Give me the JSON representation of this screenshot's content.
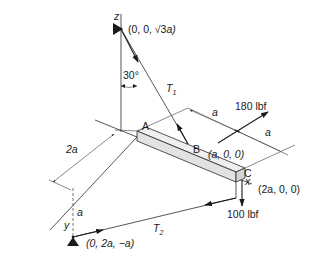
{
  "diagram": {
    "type": "3d-statics-free-body",
    "axes": {
      "z_label": "z",
      "y_label": "y",
      "x_label": "x"
    },
    "points": {
      "A": {
        "label": "A"
      },
      "B": {
        "label": "B",
        "coord": "(a, 0, 0)"
      },
      "C": {
        "label": "C",
        "coord": "(2a, 0, 0)"
      },
      "top_support": {
        "coord_prefix": "(0, 0, ",
        "coord_root": "√3",
        "coord_suffix": "a)"
      },
      "bottom_support": {
        "coord": "(0, 2a, −a)"
      }
    },
    "forces": {
      "T1": {
        "label": "T",
        "sub": "1"
      },
      "T2": {
        "label": "T",
        "sub": "2"
      },
      "F1": {
        "label": "180 lbf"
      },
      "F2": {
        "label": "100 lbf"
      }
    },
    "angle": {
      "label": "30°"
    },
    "dimensions": {
      "dim_2a": "2a",
      "dim_a_vertical": "a",
      "dim_a_top": "a",
      "dim_a_right": "a"
    },
    "colors": {
      "line": "#2a2a2a",
      "beam_fill": "#e4e4e4",
      "beam_top": "#efefef",
      "text": "#1a1a1a"
    }
  }
}
